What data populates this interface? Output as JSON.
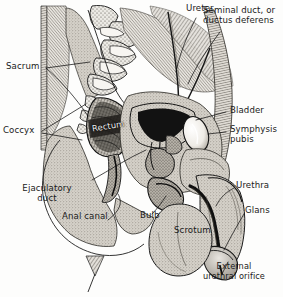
{
  "figure": {
    "style": "engraving",
    "palette": {
      "ink": "#1a1a1a",
      "paper": "#fdfdfc",
      "tissue_light": "#d8d4cd",
      "tissue_mid": "#b3aea6",
      "tissue_dark": "#6f6a63",
      "void_black": "#111111",
      "bone_white": "#f4f2ee"
    }
  },
  "labels": [
    {
      "id": "ureter",
      "text": "Ureter",
      "x": 186,
      "y": 6,
      "align": "left"
    },
    {
      "id": "seminal_duct",
      "line1": "Seminal duct, or",
      "line2": "ductus deferens",
      "x": 205,
      "y": 8,
      "align": "left"
    },
    {
      "id": "sacrum",
      "text": "Sacrum",
      "x": 8,
      "y": 64,
      "align": "left"
    },
    {
      "id": "bladder",
      "text": "Bladder",
      "x": 228,
      "y": 108,
      "align": "left"
    },
    {
      "id": "symphysis",
      "line1": "Symphysis",
      "line2": "pubis",
      "x": 228,
      "y": 127,
      "align": "left"
    },
    {
      "id": "coccyx",
      "text": "Coccyx",
      "x": 6,
      "y": 128,
      "align": "left"
    },
    {
      "id": "rectum",
      "text": "Rectum",
      "x": 92,
      "y": 126,
      "align": "left"
    },
    {
      "id": "ejaculatory",
      "line1": "Ejaculatory",
      "line2": "duct",
      "x": 42,
      "y": 186,
      "align": "center"
    },
    {
      "id": "urethra",
      "text": "Urethra",
      "x": 236,
      "y": 183,
      "align": "left"
    },
    {
      "id": "glans",
      "text": "Glans",
      "x": 246,
      "y": 208,
      "align": "left"
    },
    {
      "id": "anal_canal",
      "text": "Anal canal",
      "x": 65,
      "y": 214,
      "align": "left"
    },
    {
      "id": "bulb",
      "text": "Bulb",
      "x": 141,
      "y": 213,
      "align": "left"
    },
    {
      "id": "scrotum",
      "text": "Scrotum",
      "x": 176,
      "y": 228,
      "align": "left"
    },
    {
      "id": "ext_orifice",
      "line1": "External",
      "line2": "urethral orifice",
      "x": 232,
      "y": 264,
      "align": "center"
    }
  ],
  "structures": [
    "sacrum",
    "coccyx",
    "rectum",
    "anal canal",
    "bladder",
    "symphysis pubis",
    "ureter",
    "ductus deferens",
    "ejaculatory duct",
    "prostate",
    "bulb",
    "urethra",
    "glans",
    "scrotum",
    "external urethral orifice"
  ]
}
